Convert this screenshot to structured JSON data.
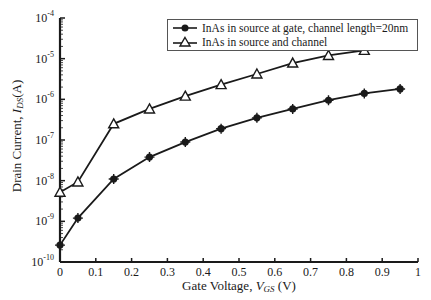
{
  "chart_data": {
    "type": "line",
    "title": "",
    "xlabel": "Gate Voltage, V_GS (V)",
    "ylabel": "Drain Current, I_DS(A)",
    "xlim": [
      0,
      1
    ],
    "ylim": [
      1e-10,
      0.0001
    ],
    "yscale": "log",
    "grid": false,
    "legend_position": "upper right",
    "x_ticks": [
      "0",
      "0.1",
      "0.2",
      "0.3",
      "0.4",
      "0.5",
      "0.6",
      "0.7",
      "0.8",
      "0.9",
      "1"
    ],
    "y_ticks": [
      "10^-10",
      "10^-9",
      "10^-8",
      "10^-7",
      "10^-6",
      "10^-5",
      "10^-4"
    ],
    "x": [
      0,
      0.05,
      0.15,
      0.25,
      0.35,
      0.45,
      0.55,
      0.65,
      0.75,
      0.85,
      0.95
    ],
    "series": [
      {
        "name": "InAs in source at gate, channel length=20nm",
        "marker": "star",
        "values": [
          2.6e-10,
          1.2e-09,
          1.1e-08,
          3.8e-08,
          8.9e-08,
          1.9e-07,
          3.5e-07,
          5.8e-07,
          9.5e-07,
          1.4e-06,
          1.8e-06
        ]
      },
      {
        "name": "InAs in source and channel",
        "marker": "triangle",
        "values": [
          5.2e-09,
          9.3e-09,
          2.5e-07,
          5.8e-07,
          1.2e-06,
          2.3e-06,
          4.2e-06,
          7.8e-06,
          1.2e-05,
          1.6e-05,
          2.1e-05
        ]
      }
    ]
  },
  "axes": {
    "ylabel_main": "Drain Current, ",
    "ylabel_var": "I",
    "ylabel_sub": "DS",
    "ylabel_unit": "(A)",
    "xlabel_main": "Gate Voltage, ",
    "xlabel_var": "V",
    "xlabel_sub": "GS",
    "xlabel_unit": " (V)"
  },
  "legend": {
    "items": [
      {
        "label": "InAs in source at gate, channel length=20nm"
      },
      {
        "label": "InAs in source and channel"
      }
    ]
  }
}
